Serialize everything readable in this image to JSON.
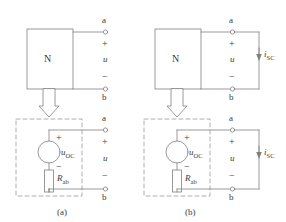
{
  "figure": {
    "title": "",
    "type": "circuit-diagram",
    "stroke_color": "#808080",
    "text_color": "#3a3a3a",
    "background": "#ffffff",
    "dashed_color": "#999999"
  },
  "panels": [
    {
      "id": "a",
      "caption": "(a)",
      "top_circuit": {
        "box_label": "N",
        "terminal_top": "a",
        "terminal_bottom": "b",
        "plus_sign": "+",
        "minus_sign": "−",
        "voltage_label": "u",
        "condition": "open-circuit"
      },
      "bottom_circuit": {
        "source_label_base": "u",
        "source_label_sub": "OC",
        "resistor_label_base": "R",
        "resistor_label_sub": "ab",
        "source_plus": "+",
        "source_minus": "−",
        "terminal_top": "a",
        "terminal_bottom": "b",
        "plus_sign": "+",
        "minus_sign": "−",
        "voltage_label": "u",
        "enclosure": "dashed"
      },
      "transform_arrow": "down-block-arrow"
    },
    {
      "id": "b",
      "caption": "(b)",
      "top_circuit": {
        "box_label": "N",
        "terminal_top": "a",
        "terminal_bottom": "b",
        "plus_sign": "+",
        "minus_sign": "−",
        "voltage_label": "u",
        "current_label_base": "i",
        "current_label_sub": "SC",
        "condition": "short-circuit"
      },
      "bottom_circuit": {
        "source_label_base": "u",
        "source_label_sub": "OC",
        "resistor_label_base": "R",
        "resistor_label_sub": "ab",
        "source_plus": "+",
        "source_minus": "−",
        "terminal_top": "a",
        "terminal_bottom": "b",
        "plus_sign": "+",
        "minus_sign": "−",
        "voltage_label": "u",
        "current_label_base": "i",
        "current_label_sub": "SC",
        "enclosure": "dashed"
      },
      "transform_arrow": "down-block-arrow"
    }
  ]
}
